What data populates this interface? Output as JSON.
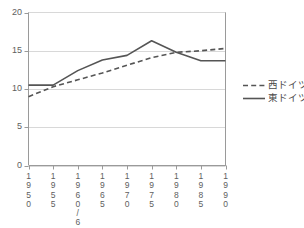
{
  "chart_data": {
    "type": "line",
    "title": "",
    "xlabel": "",
    "ylabel": "",
    "xlim": [
      0,
      8
    ],
    "ylim": [
      0,
      20
    ],
    "grid": true,
    "legend_position": "right",
    "categories": [
      "1950",
      "1955",
      "1960/61",
      "1965",
      "1970",
      "1975",
      "1980",
      "1985",
      "1990"
    ],
    "xtick_labels_vertical": [
      "1\n9\n5\n0",
      "1\n9\n5\n5",
      "1\n9\n6\n0\n/\n6\n1",
      "1\n9\n6\n5",
      "1\n9\n7\n0",
      "1\n9\n7\n5",
      "1\n9\n8\n0",
      "1\n9\n8\n5",
      "1\n9\n9\n0"
    ],
    "ytick_labels": [
      "20",
      "15",
      "10",
      "5",
      "0"
    ],
    "ytick_values": [
      20,
      15,
      10,
      5,
      0
    ],
    "series": [
      {
        "name": "西ドイツ",
        "style": "dashed",
        "color": "#555555",
        "values": [
          9.0,
          10.3,
          11.2,
          12.1,
          13.1,
          14.1,
          14.8,
          15.0,
          15.3
        ]
      },
      {
        "name": "東ドイツ",
        "style": "solid",
        "color": "#555555",
        "values": [
          10.5,
          10.5,
          12.4,
          13.8,
          14.4,
          16.3,
          14.8,
          13.7,
          13.7
        ]
      }
    ]
  },
  "legend": {
    "items": [
      {
        "label": "西ドイツ",
        "style": "dashed"
      },
      {
        "label": "東ドイツ",
        "style": "solid"
      }
    ]
  }
}
